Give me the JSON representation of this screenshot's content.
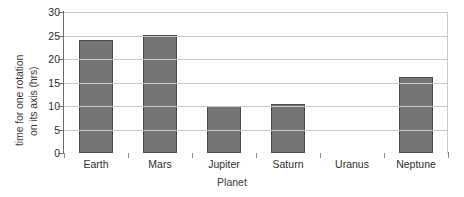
{
  "chart_data": {
    "type": "bar",
    "title": "",
    "xlabel": "Planet",
    "ylabel_lines": [
      "time for one rotation",
      "on its axis (hrs)"
    ],
    "ylabel": "time for one rotation on its axis (hrs)",
    "categories": [
      "Earth",
      "Mars",
      "Jupiter",
      "Saturn",
      "Uranus",
      "Neptune"
    ],
    "values": [
      24,
      25.2,
      10,
      10.5,
      0,
      16.2
    ],
    "ylim": [
      0,
      30
    ],
    "yticks": [
      0,
      5,
      10,
      15,
      20,
      25,
      30
    ],
    "ytick_labels": [
      "0",
      "5",
      "10",
      "15",
      "20",
      "25",
      "30"
    ],
    "grid": true,
    "legend": false,
    "bar_color": "#757575",
    "bar_edge_color": "#4a4a4a",
    "gridline_color": "#c9c9c9",
    "axis_color": "#6b6b6b",
    "background": "#ffffff"
  }
}
